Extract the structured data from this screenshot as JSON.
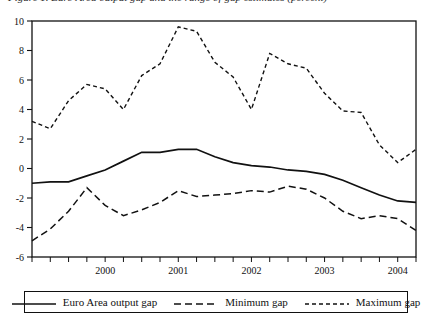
{
  "figure": {
    "caption": "Figure 1. Euro Area output gap and the range of gap estimates (percent)"
  },
  "chart_data": {
    "type": "line",
    "title": "",
    "xlabel": "",
    "ylabel": "",
    "ylim": [
      -6,
      10
    ],
    "xlim": [
      1999.0,
      2004.25
    ],
    "grid": false,
    "legend_position": "below-plot",
    "ytick_labels": [
      "10",
      "8",
      "6",
      "4",
      "2",
      "0",
      "-2",
      "-4",
      "-6"
    ],
    "ytick_values": [
      10,
      8,
      6,
      4,
      2,
      0,
      -2,
      -4,
      -6
    ],
    "xtick_labels": [
      "2000",
      "2001",
      "2002",
      "2003",
      "2004"
    ],
    "xtick_values": [
      2000,
      2001,
      2002,
      2003,
      2004
    ],
    "x": [
      1999.0,
      1999.25,
      1999.5,
      1999.75,
      2000.0,
      2000.25,
      2000.5,
      2000.75,
      2001.0,
      2001.25,
      2001.5,
      2001.75,
      2002.0,
      2002.25,
      2002.5,
      2002.75,
      2003.0,
      2003.25,
      2003.5,
      2003.75,
      2004.0,
      2004.25
    ],
    "x_period_labels": [
      "1999Q1",
      "1999Q2",
      "1999Q3",
      "1999Q4",
      "2000Q1",
      "2000Q2",
      "2000Q3",
      "2000Q4",
      "2001Q1",
      "2001Q2",
      "2001Q3",
      "2001Q4",
      "2002Q1",
      "2002Q2",
      "2002Q3",
      "2002Q4",
      "2003Q1",
      "2003Q2",
      "2003Q3",
      "2003Q4",
      "2004Q1",
      "2004Q2"
    ],
    "series": [
      {
        "name": "Euro Area output gap",
        "style": "solid",
        "values": [
          -1.0,
          -0.9,
          -0.9,
          -0.5,
          -0.1,
          0.5,
          1.1,
          1.1,
          1.3,
          1.3,
          0.8,
          0.4,
          0.2,
          0.1,
          -0.1,
          -0.2,
          -0.4,
          -0.8,
          -1.3,
          -1.8,
          -2.2,
          -2.3
        ]
      },
      {
        "name": "Minimum gap",
        "style": "dashed",
        "values": [
          -4.9,
          -4.1,
          -2.9,
          -1.3,
          -2.5,
          -3.2,
          -2.8,
          -2.3,
          -1.5,
          -1.9,
          -1.8,
          -1.7,
          -1.5,
          -1.6,
          -1.2,
          -1.4,
          -2.0,
          -2.9,
          -3.4,
          -3.2,
          -3.4,
          -4.2
        ]
      },
      {
        "name": "Maximum gap",
        "style": "dotted",
        "values": [
          3.2,
          2.7,
          4.6,
          5.7,
          5.4,
          4.0,
          6.3,
          7.1,
          9.6,
          9.3,
          7.2,
          6.2,
          4.0,
          7.8,
          7.1,
          6.8,
          5.1,
          3.9,
          3.8,
          1.6,
          0.4,
          1.3
        ]
      }
    ]
  },
  "legend": {
    "items": [
      {
        "label": "Euro Area output gap",
        "style": "solid"
      },
      {
        "label": "Minimum gap",
        "style": "dashed"
      },
      {
        "label": "Maximum gap",
        "style": "dotted"
      }
    ]
  }
}
